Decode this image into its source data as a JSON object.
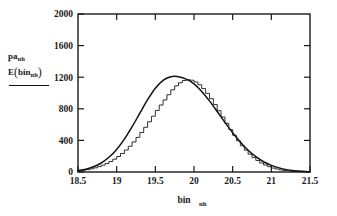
{
  "chart_data": {
    "type": "bar",
    "title": "",
    "subtitle": "",
    "xlabel": "bin",
    "xlabel_sub": "nh",
    "ylabel_line1": "pa",
    "ylabel_line1_sub": "nh",
    "ylabel_line2_head": "E",
    "ylabel_line2_arg": "bin",
    "ylabel_line2_arg_sub": "nh",
    "xlim": [
      18.5,
      21.5
    ],
    "ylim": [
      0,
      2000
    ],
    "xticks": [
      "18.5",
      "19",
      "19.5",
      "20",
      "20.5",
      "21",
      "21.5"
    ],
    "xtick_values": [
      18.5,
      19,
      19.5,
      20,
      20.5,
      21,
      21.5
    ],
    "yticks": [
      "0",
      "400",
      "800",
      "1200",
      "1600",
      "2000"
    ],
    "ytick_values": [
      0,
      400,
      800,
      1200,
      1600,
      2000
    ],
    "grid": false,
    "legend_position": "left-outside",
    "bin_width": 0.05,
    "series": [
      {
        "name": "histogram",
        "style": "step",
        "x": [
          18.5,
          18.55,
          18.6,
          18.65,
          18.7,
          18.75,
          18.8,
          18.85,
          18.9,
          18.95,
          19.0,
          19.05,
          19.1,
          19.15,
          19.2,
          19.25,
          19.3,
          19.35,
          19.4,
          19.45,
          19.5,
          19.55,
          19.6,
          19.65,
          19.7,
          19.75,
          19.8,
          19.85,
          19.9,
          19.95,
          20.0,
          20.05,
          20.1,
          20.15,
          20.2,
          20.25,
          20.3,
          20.35,
          20.4,
          20.45,
          20.5,
          20.55,
          20.6,
          20.65,
          20.7,
          20.75,
          20.8,
          20.85,
          20.9,
          20.95,
          21.0,
          21.05,
          21.1,
          21.15,
          21.2,
          21.25,
          21.3,
          21.35,
          21.4,
          21.45
        ],
        "values": [
          15,
          22,
          30,
          40,
          52,
          68,
          86,
          108,
          133,
          162,
          196,
          234,
          278,
          326,
          380,
          438,
          500,
          566,
          636,
          706,
          778,
          848,
          912,
          978,
          1040,
          1090,
          1130,
          1158,
          1168,
          1162,
          1140,
          1104,
          1056,
          996,
          928,
          854,
          776,
          696,
          616,
          538,
          464,
          396,
          332,
          276,
          226,
          182,
          146,
          114,
          88,
          68,
          50,
          38,
          27,
          19,
          13,
          9,
          6,
          4,
          2,
          1
        ]
      },
      {
        "name": "fitted curve",
        "style": "line",
        "peak_value": 1208,
        "peak_x": 19.78,
        "sigma": 0.43,
        "x": [
          18.5,
          18.6,
          18.7,
          18.8,
          18.9,
          19.0,
          19.1,
          19.2,
          19.3,
          19.4,
          19.5,
          19.6,
          19.7,
          19.78,
          19.9,
          20.0,
          20.1,
          20.2,
          20.3,
          20.4,
          20.5,
          20.6,
          20.7,
          20.8,
          20.9,
          21.0,
          21.1,
          21.2,
          21.3,
          21.4,
          21.5
        ],
        "values": [
          18,
          36,
          66,
          114,
          186,
          286,
          416,
          573,
          745,
          915,
          1060,
          1160,
          1205,
          1208,
          1175,
          1115,
          1020,
          900,
          766,
          628,
          496,
          378,
          276,
          194,
          130,
          84,
          52,
          30,
          17,
          9,
          4
        ]
      }
    ]
  }
}
